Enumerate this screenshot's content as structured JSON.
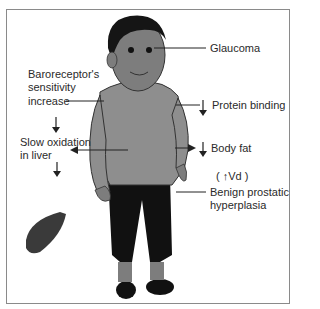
{
  "diagram": {
    "type": "anatomical-illustration",
    "labels": {
      "glaucoma": "Glaucoma",
      "baroreceptor_line1": "Baroreceptor's",
      "baroreceptor_line2": "sensitivity",
      "baroreceptor_line3": "increase",
      "protein_binding": "Protein binding",
      "slow_oxidation_line1": "Slow oxidation",
      "slow_oxidation_line2": "in liver",
      "body_fat": "Body fat",
      "vd": "( ↑Vd )",
      "bph_line1": "Benign prostatic",
      "bph_line2": "hyperplasia"
    },
    "arrows": {
      "protein_binding": "down",
      "body_fat": "down",
      "vd": "up"
    },
    "colors": {
      "skin": "#7d7d7d",
      "shirt": "#8e8e8e",
      "pants": "#111111",
      "hair": "#151515",
      "liver": "#3a3a3a",
      "text": "#2a2a2a",
      "border": "#8a8a8a"
    }
  }
}
